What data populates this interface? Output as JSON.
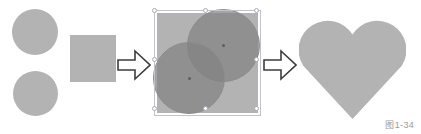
{
  "figure": {
    "caption": "图1-34",
    "background_color": "#ffffff",
    "shape_fill_color": "#b3b3b3",
    "overlap_fill_color": "#828282",
    "selection_frame_color": "#c2c2cc",
    "arrow_outline_color": "#3d3d3d"
  },
  "stages": {
    "source": {
      "label": "source-shapes",
      "items": [
        {
          "name": "circle-top",
          "shape": "circle"
        },
        {
          "name": "circle-bottom",
          "shape": "circle"
        },
        {
          "name": "square",
          "shape": "square"
        }
      ]
    },
    "composite": {
      "label": "arranged-shapes-selected",
      "items": [
        {
          "name": "square",
          "shape": "square"
        },
        {
          "name": "circle-top-right",
          "shape": "circle"
        },
        {
          "name": "circle-bottom-left",
          "shape": "circle"
        }
      ],
      "selection_handles": 8
    },
    "result": {
      "label": "merged-heart",
      "items": [
        {
          "name": "heart",
          "shape": "heart"
        }
      ]
    }
  },
  "arrows": [
    {
      "name": "arrow-step-1",
      "glyph": "right-block-arrow"
    },
    {
      "name": "arrow-step-2",
      "glyph": "right-block-arrow"
    }
  ]
}
